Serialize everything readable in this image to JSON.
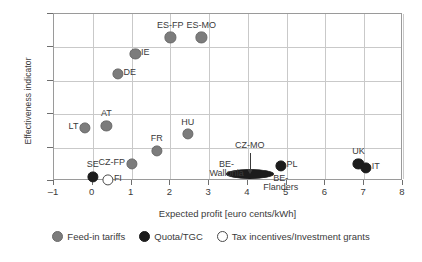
{
  "chart_data": {
    "type": "scatter",
    "title": "",
    "xlabel": "Expected profit [euro cents/kWh]",
    "ylabel": "Effectiveness indicator",
    "xlim": [
      -1,
      8
    ],
    "ylim": [
      0,
      25
    ],
    "xticks": [
      "-1",
      "0",
      "1",
      "2",
      "3",
      "4",
      "5",
      "6",
      "7",
      "8"
    ],
    "yticks": [
      "0%",
      "5%",
      "10%",
      "15%",
      "20%",
      "25%"
    ],
    "grid": true,
    "legend_position": "bottom-center",
    "series": [
      {
        "name": "Feed-in tariffs",
        "key": "fit",
        "color": "#7c7c7c",
        "points": [
          {
            "label": "LT",
            "x": -0.2,
            "y": 8.0,
            "label_pos": "left"
          },
          {
            "label": "AT",
            "x": 0.35,
            "y": 8.3,
            "label_pos": "top"
          },
          {
            "label": "DE",
            "x": 0.65,
            "y": 16.0,
            "label_pos": "right"
          },
          {
            "label": "IE",
            "x": 1.1,
            "y": 19.0,
            "label_pos": "right"
          },
          {
            "label": "CZ-FP",
            "x": 1.0,
            "y": 2.5,
            "label_pos": "left"
          },
          {
            "label": "FR",
            "x": 1.65,
            "y": 4.5,
            "label_pos": "top"
          },
          {
            "label": "ES-FP",
            "x": 2.0,
            "y": 21.5,
            "label_pos": "top"
          },
          {
            "label": "HU",
            "x": 2.45,
            "y": 7.0,
            "label_pos": "top"
          },
          {
            "label": "ES-MO",
            "x": 2.8,
            "y": 21.5,
            "label_pos": "top"
          }
        ]
      },
      {
        "name": "Quota/TGC",
        "key": "quota",
        "color": "#1c1c1c",
        "points": [
          {
            "label": "SE",
            "x": 0.0,
            "y": 0.6,
            "label_pos": "top"
          },
          {
            "label": "CZ-MO",
            "x": 4.05,
            "y": 1.0,
            "label_pos": "callout"
          },
          {
            "label": "PL",
            "x": 4.85,
            "y": 2.2,
            "label_pos": "right"
          },
          {
            "label": "UK",
            "x": 6.85,
            "y": 2.6,
            "label_pos": "top"
          },
          {
            "label": "IT",
            "x": 7.05,
            "y": 2.0,
            "label_pos": "right"
          }
        ]
      },
      {
        "name": "Tax incentives/Investment grants",
        "key": "tax",
        "color": "#ffffff",
        "points": [
          {
            "label": "FI",
            "x": 0.4,
            "y": 0.2,
            "label_pos": "right"
          }
        ]
      }
    ],
    "annotations": [
      {
        "label": "BE-Wallonia",
        "x": 3.45,
        "y": 2.0,
        "note": "wide flat ellipse marker spanning x 3.5-4.6 at y~1%"
      },
      {
        "label": "BE-Flanders",
        "x": 4.85,
        "y": -1.3,
        "note": "label below PL marker"
      },
      {
        "label": "CZ-MO",
        "x": 4.05,
        "y": 4.6,
        "note": "callout with downward arrow to flat ellipse"
      }
    ]
  },
  "legend": {
    "items": [
      {
        "label": "Feed-in tariffs",
        "key": "fit"
      },
      {
        "label": "Quota/TGC",
        "key": "quota"
      },
      {
        "label": "Tax incentives/Investment grants",
        "key": "tax"
      }
    ]
  }
}
